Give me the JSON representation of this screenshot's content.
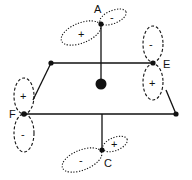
{
  "diagram": {
    "type": "molecular-orbital-diagram",
    "colors": {
      "line": "#111111",
      "background": "#ffffff"
    },
    "atoms": [
      {
        "id": "A",
        "label": "A",
        "lobe_signs": [
          "+",
          "-"
        ]
      },
      {
        "id": "E",
        "label": "E",
        "lobe_signs": [
          "-",
          "+"
        ]
      },
      {
        "id": "F",
        "label": "F",
        "lobe_signs": [
          "+",
          "-"
        ]
      },
      {
        "id": "C",
        "label": "C",
        "lobe_signs": [
          "-",
          "+"
        ]
      }
    ],
    "center": {
      "label": ""
    }
  }
}
